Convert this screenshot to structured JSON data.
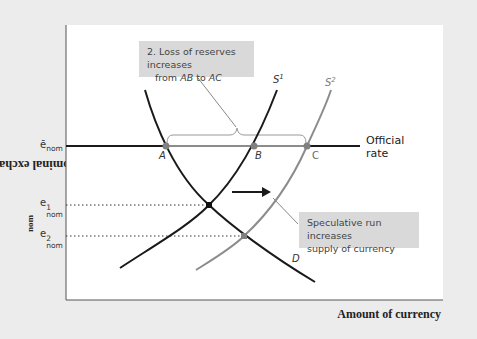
{
  "figure": {
    "y_axis_label": "Nominal exchange rate, e",
    "y_axis_label_sub": "nom",
    "x_axis_label": "Amount of currency",
    "y_ticks": [
      {
        "id": "ebar",
        "base": "ē",
        "sup": "",
        "sub": "nom"
      },
      {
        "id": "e1",
        "base": "e",
        "sup": "1",
        "sub": "nom"
      },
      {
        "id": "e2",
        "base": "e",
        "sup": "2",
        "sub": "nom"
      }
    ],
    "official_rate_label_line1": "Official",
    "official_rate_label_line2": "rate",
    "curves": {
      "s1": "S",
      "s1_sup": "1",
      "s2": "S",
      "s2_sup": "2",
      "d": "D"
    },
    "points": {
      "a": "A",
      "b": "B",
      "c": "C"
    },
    "callouts": {
      "reserves_line1": "2. Loss of reserves increases",
      "reserves_line2_pre": "from ",
      "reserves_line2_ab": "AB",
      "reserves_line2_mid": " to ",
      "reserves_line2_ac": "AC",
      "speculative_line1": "Speculative run increases",
      "speculative_line2": "supply of currency"
    },
    "colors": {
      "background": "#ececec",
      "plot_bg": "#ffffff",
      "primary_curve": "#1a1a1a",
      "secondary_curve": "#8c8c8c",
      "callout_bg": "#d9d9d9",
      "point_fill": "#808080"
    }
  }
}
